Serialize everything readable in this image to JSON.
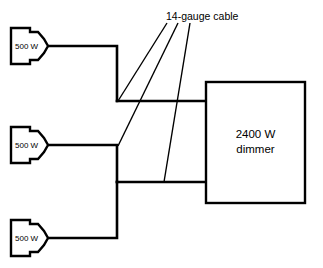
{
  "diagram": {
    "type": "electrical-wiring-diagram",
    "background_color": "#ffffff",
    "line_color": "#000000",
    "annotation": {
      "label": "14-gauge cable",
      "leader_count": 3
    },
    "fixtures": [
      {
        "id": "fixture-top",
        "label": "500 W",
        "position": "top-left"
      },
      {
        "id": "fixture-middle",
        "label": "500 W",
        "position": "middle-left"
      },
      {
        "id": "fixture-bottom",
        "label": "500 W",
        "position": "bottom-left"
      }
    ],
    "dimmer": {
      "id": "dimmer-box",
      "label_line1": "2400 W",
      "label_line2": "dimmer"
    }
  }
}
